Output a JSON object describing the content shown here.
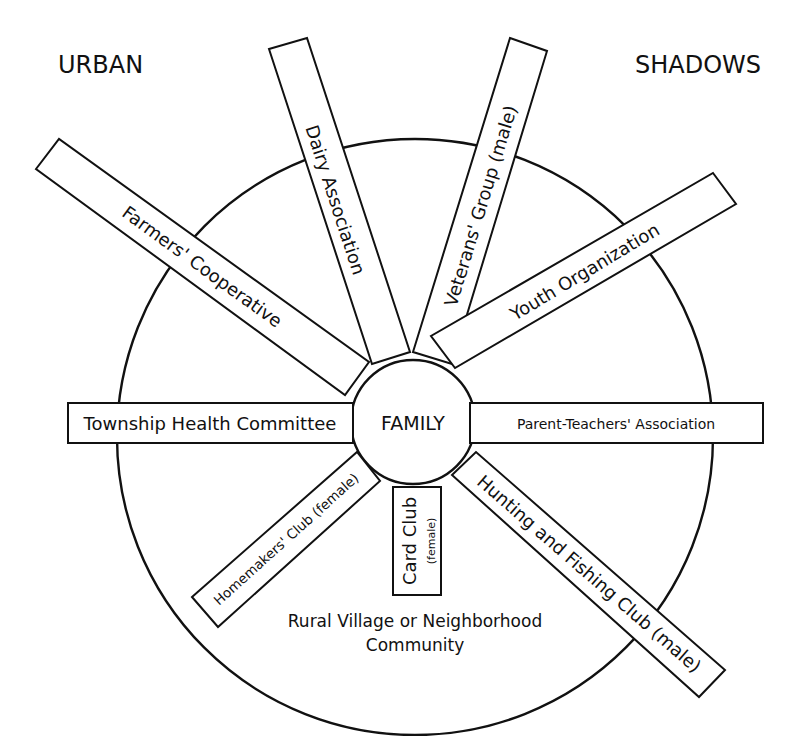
{
  "corner_labels": {
    "left": "URBAN",
    "right": "SHADOWS"
  },
  "center": {
    "label": "FAMILY"
  },
  "outer_ring": {
    "label_line1": "Rural Village or Neighborhood",
    "label_line2": "Community"
  },
  "spokes": [
    {
      "id": "farmers",
      "label": "Farmers' Cooperative"
    },
    {
      "id": "dairy",
      "label": "Dairy Association"
    },
    {
      "id": "veterans",
      "label": "Veterans' Group (male)"
    },
    {
      "id": "youth",
      "label": "Youth Organization"
    },
    {
      "id": "township",
      "label": "Township Health Committee"
    },
    {
      "id": "pta",
      "label": "Parent-Teachers' Association"
    },
    {
      "id": "homemakers",
      "label": "Homemakers' Club (female)"
    },
    {
      "id": "cardclub",
      "label": "Card Club",
      "sublabel": "(female)"
    },
    {
      "id": "hunting",
      "label": "Hunting and Fishing Club (male)"
    }
  ],
  "colors": {
    "ink": "#111111",
    "background": "#ffffff"
  }
}
